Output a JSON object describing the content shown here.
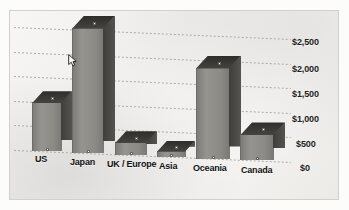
{
  "chart_data": {
    "type": "bar",
    "title": "",
    "subtitle": "",
    "xlabel": "",
    "ylabel": "",
    "categories": [
      "US",
      "Japan",
      "UK / Europe",
      "Asia",
      "Oceania",
      "Canada"
    ],
    "values": [
      1000,
      2550,
      260,
      120,
      1850,
      530
    ],
    "series": [
      {
        "name": "Value",
        "values": [
          1000,
          2550,
          260,
          120,
          1850,
          530
        ]
      }
    ],
    "ytick_labels": [
      "$2,500",
      "$2,000",
      "$1,500",
      "$1,000",
      "$500",
      "$0"
    ],
    "ytick_values": [
      2500,
      2000,
      1500,
      1000,
      500,
      0
    ],
    "ylim": [
      0,
      3000
    ],
    "grid": true,
    "grid_style": "dotted",
    "legend": "none",
    "projection": "3d-perspective",
    "annotations": []
  },
  "chart": {
    "bars": [
      {
        "label": "US",
        "value": 1000,
        "label_text": "US"
      },
      {
        "label": "Japan",
        "value": 2550,
        "label_text": "Japan"
      },
      {
        "label": "UK / Europe",
        "value": 260,
        "label_text": "UK / Europe"
      },
      {
        "label": "Asia",
        "value": 120,
        "label_text": "Asia"
      },
      {
        "label": "Oceania",
        "value": 1850,
        "label_text": "Oceania"
      },
      {
        "label": "Canada",
        "value": 530,
        "label_text": "Canada"
      }
    ],
    "axis": {
      "tick_0": "$2,500",
      "tick_1": "$2,000",
      "tick_2": "$1,500",
      "tick_3": "$1,000",
      "tick_4": "$500",
      "tick_5": "$0"
    },
    "colors": {
      "bar_face": "#8c8a85",
      "bar_side": "#46453f",
      "bar_top": "#35342f",
      "background": "#f3f2f0",
      "gridline": "#a9a7a3",
      "text": "#121212",
      "frame": "#d2d0cc"
    }
  },
  "cursor": {
    "name": "mouse-pointer"
  }
}
